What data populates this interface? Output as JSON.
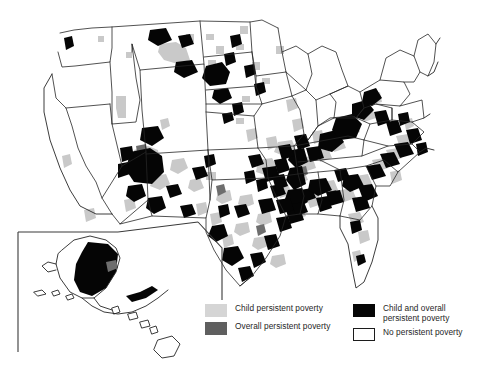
{
  "figure": {
    "type": "choropleth-map",
    "region": "United States (counties)",
    "insets": [
      "Alaska",
      "Hawaii"
    ]
  },
  "legend": {
    "columns": [
      {
        "items": [
          {
            "swatch": "light-gray-swatch",
            "color": "#d5d5d5",
            "label": "Child persistent poverty"
          },
          {
            "swatch": "dark-gray-swatch",
            "color": "#5f5f5f",
            "label": "Overall persistent poverty"
          }
        ]
      },
      {
        "items": [
          {
            "swatch": "black-swatch",
            "color": "#060606",
            "label": "Child and overall\npersistent poverty"
          },
          {
            "swatch": "white-swatch",
            "color": "#ffffff",
            "label": "No persistent poverty"
          }
        ]
      }
    ]
  },
  "map_data": {
    "categories": [
      "No persistent poverty",
      "Child persistent poverty",
      "Overall persistent poverty",
      "Child and overall persistent poverty"
    ],
    "category_colors": [
      "#ffffff",
      "#c9c9c9",
      "#6e6e6e",
      "#050505"
    ],
    "notable_clusters": [
      {
        "region": "Mississippi Delta",
        "category": "Child and overall persistent poverty"
      },
      {
        "region": "Alabama Black Belt",
        "category": "Child and overall persistent poverty"
      },
      {
        "region": "Central Appalachia / Eastern Kentucky",
        "category": "Child and overall persistent poverty"
      },
      {
        "region": "Coastal Carolinas",
        "category": "Child and overall persistent poverty"
      },
      {
        "region": "South Texas border",
        "category": "Child and overall persistent poverty"
      },
      {
        "region": "Four Corners / Navajo Nation",
        "category": "Child and overall persistent poverty"
      },
      {
        "region": "Dakotas reservations",
        "category": "Child and overall persistent poverty"
      },
      {
        "region": "Western Alaska",
        "category": "Child and overall persistent poverty"
      },
      {
        "region": "Northeast and Upper Midwest",
        "category": "No persistent poverty"
      },
      {
        "region": "Hawaii",
        "category": "No persistent poverty"
      }
    ]
  }
}
